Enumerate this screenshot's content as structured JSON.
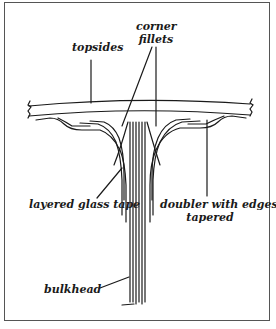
{
  "diagram": {
    "type": "cross-section",
    "labels": {
      "topsides": "topsides",
      "corner_fillets_line1": "corner",
      "corner_fillets_line2": "fillets",
      "layered_glass_tape": "layered glass tape",
      "doubler_line1": "doubler with edges",
      "doubler_line2": "tapered",
      "bulkhead": "bulkhead"
    },
    "colors": {
      "ink": "#1a1a1a",
      "frame": "#555555",
      "background": "#ffffff"
    }
  }
}
